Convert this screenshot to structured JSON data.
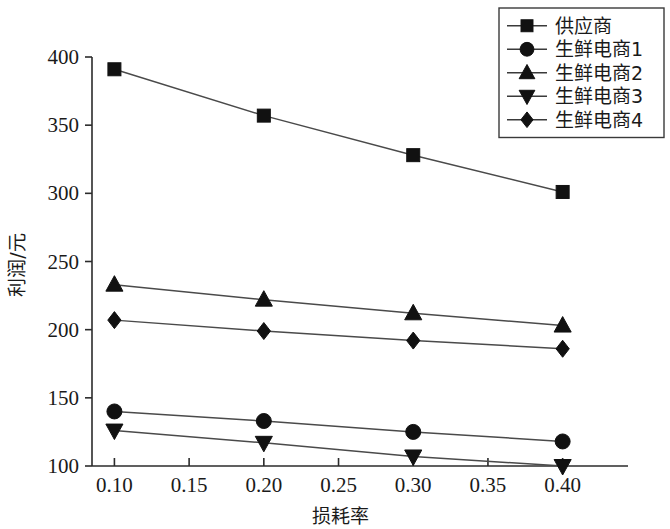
{
  "chart_data": {
    "type": "line",
    "title": "",
    "xlabel": "损耗率",
    "ylabel": "利润/元",
    "x": [
      0.1,
      0.2,
      0.3,
      0.4
    ],
    "xlim": [
      0.085,
      0.425
    ],
    "ylim": [
      100,
      400
    ],
    "xticks": [
      "0.10",
      "0.15",
      "0.20",
      "0.25",
      "0.30",
      "0.35",
      "0.40"
    ],
    "xtick_values": [
      0.1,
      0.15,
      0.2,
      0.25,
      0.3,
      0.35,
      0.4
    ],
    "yticks": [
      "100",
      "150",
      "200",
      "250",
      "300",
      "350",
      "400"
    ],
    "ytick_values": [
      100,
      150,
      200,
      250,
      300,
      350,
      400
    ],
    "grid": false,
    "legend_position": "top-right",
    "series": [
      {
        "name": "供应商",
        "marker": "square",
        "values": [
          391,
          357,
          328,
          301
        ]
      },
      {
        "name": "生鲜电商1",
        "marker": "circle",
        "values": [
          140,
          133,
          125,
          118
        ]
      },
      {
        "name": "生鲜电商2",
        "marker": "triangle-up",
        "values": [
          233,
          222,
          212,
          203
        ]
      },
      {
        "name": "生鲜电商3",
        "marker": "triangle-down",
        "values": [
          126,
          117,
          107,
          100
        ]
      },
      {
        "name": "生鲜电商4",
        "marker": "diamond",
        "values": [
          207,
          199,
          192,
          186
        ]
      }
    ]
  },
  "legend": {
    "entries": [
      {
        "label": "供应商"
      },
      {
        "label": "生鲜电商1"
      },
      {
        "label": "生鲜电商2"
      },
      {
        "label": "生鲜电商3"
      },
      {
        "label": "生鲜电商4"
      }
    ]
  },
  "colors": {
    "line": "#4a4a4a",
    "marker": "#111111",
    "axis": "#2b2b2b",
    "background": "#ffffff"
  }
}
